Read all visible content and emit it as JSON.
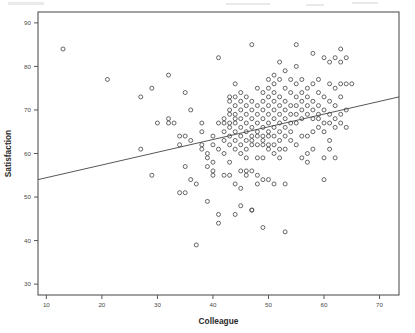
{
  "chart_data": {
    "type": "scatter",
    "title": "",
    "subtitle": "",
    "xlabel": "Colleague",
    "ylabel": "Satisfaction",
    "xlim": [
      8.5,
      73.5
    ],
    "ylim": [
      27.5,
      92.5
    ],
    "xticks": [
      10,
      20,
      30,
      40,
      50,
      60,
      70
    ],
    "xticklabels": [
      "10",
      "20",
      "30",
      "40",
      "50",
      "60",
      "70"
    ],
    "yticks": [
      30,
      40,
      50,
      60,
      70,
      80,
      90
    ],
    "yticklabels": [
      "30",
      "40",
      "50",
      "60",
      "70",
      "80",
      "90"
    ],
    "grid": false,
    "legend": false,
    "marker": "open-circle",
    "marker_color": "#555555",
    "line_color": "#444444",
    "frame": true,
    "fit_line": {
      "type": "linear-regression",
      "x_start": 8.5,
      "y_start": 54.0,
      "x_end": 73.5,
      "y_end": 73.0,
      "style": "solid-thin"
    },
    "points": [
      [
        13,
        84
      ],
      [
        21,
        77
      ],
      [
        27,
        73
      ],
      [
        27,
        61
      ],
      [
        29,
        75
      ],
      [
        29,
        55
      ],
      [
        30,
        67
      ],
      [
        32,
        78
      ],
      [
        32,
        68
      ],
      [
        32,
        67
      ],
      [
        33,
        67
      ],
      [
        34,
        64
      ],
      [
        34,
        62
      ],
      [
        34,
        51
      ],
      [
        35,
        57
      ],
      [
        35,
        64
      ],
      [
        35,
        74
      ],
      [
        35,
        51
      ],
      [
        36,
        70
      ],
      [
        36,
        63
      ],
      [
        36,
        54
      ],
      [
        37,
        39
      ],
      [
        37,
        53
      ],
      [
        38,
        65
      ],
      [
        38,
        61
      ],
      [
        38,
        62
      ],
      [
        38,
        67
      ],
      [
        39,
        60
      ],
      [
        39,
        59
      ],
      [
        39,
        57
      ],
      [
        39,
        49
      ],
      [
        40,
        64
      ],
      [
        40,
        62
      ],
      [
        40,
        58
      ],
      [
        40,
        55
      ],
      [
        40,
        56
      ],
      [
        41,
        67
      ],
      [
        41,
        61
      ],
      [
        41,
        46
      ],
      [
        41,
        44
      ],
      [
        41,
        82
      ],
      [
        42,
        65
      ],
      [
        42,
        68
      ],
      [
        42,
        63
      ],
      [
        42,
        60
      ],
      [
        42,
        55
      ],
      [
        43,
        70
      ],
      [
        43,
        73
      ],
      [
        43,
        72
      ],
      [
        43,
        69
      ],
      [
        43,
        67
      ],
      [
        43,
        66
      ],
      [
        43,
        64
      ],
      [
        43,
        62
      ],
      [
        43,
        58
      ],
      [
        44,
        76
      ],
      [
        44,
        71
      ],
      [
        44,
        69
      ],
      [
        44,
        68
      ],
      [
        44,
        67
      ],
      [
        44,
        65
      ],
      [
        44,
        63
      ],
      [
        44,
        61
      ],
      [
        44,
        53
      ],
      [
        44,
        46
      ],
      [
        45,
        74
      ],
      [
        45,
        72
      ],
      [
        45,
        70
      ],
      [
        45,
        68
      ],
      [
        45,
        66
      ],
      [
        45,
        64
      ],
      [
        45,
        62
      ],
      [
        45,
        56
      ],
      [
        45,
        52
      ],
      [
        45,
        48
      ],
      [
        46,
        73
      ],
      [
        46,
        71
      ],
      [
        46,
        69
      ],
      [
        46,
        67
      ],
      [
        46,
        65
      ],
      [
        46,
        63
      ],
      [
        46,
        61
      ],
      [
        46,
        56
      ],
      [
        46,
        55
      ],
      [
        47,
        85
      ],
      [
        47,
        72
      ],
      [
        47,
        70
      ],
      [
        47,
        68
      ],
      [
        47,
        66
      ],
      [
        47,
        64
      ],
      [
        47,
        63
      ],
      [
        47,
        56
      ],
      [
        47,
        47
      ],
      [
        47,
        47
      ],
      [
        48,
        75
      ],
      [
        48,
        71
      ],
      [
        48,
        69
      ],
      [
        48,
        67
      ],
      [
        48,
        65
      ],
      [
        48,
        64
      ],
      [
        48,
        62
      ],
      [
        48,
        55
      ],
      [
        48,
        53
      ],
      [
        49,
        74
      ],
      [
        49,
        72
      ],
      [
        49,
        70
      ],
      [
        49,
        68
      ],
      [
        49,
        66
      ],
      [
        49,
        64
      ],
      [
        49,
        62
      ],
      [
        49,
        59
      ],
      [
        49,
        54
      ],
      [
        49,
        43
      ],
      [
        50,
        77
      ],
      [
        50,
        75
      ],
      [
        50,
        73
      ],
      [
        50,
        71
      ],
      [
        50,
        69
      ],
      [
        50,
        67
      ],
      [
        50,
        65
      ],
      [
        50,
        64
      ],
      [
        50,
        62
      ],
      [
        50,
        54
      ],
      [
        51,
        78
      ],
      [
        51,
        76
      ],
      [
        51,
        74
      ],
      [
        51,
        72
      ],
      [
        51,
        70
      ],
      [
        51,
        68
      ],
      [
        51,
        66
      ],
      [
        51,
        64
      ],
      [
        51,
        62
      ],
      [
        51,
        53
      ],
      [
        52,
        81
      ],
      [
        52,
        77
      ],
      [
        52,
        73
      ],
      [
        52,
        71
      ],
      [
        52,
        69
      ],
      [
        52,
        67
      ],
      [
        52,
        65
      ],
      [
        52,
        63
      ],
      [
        52,
        61
      ],
      [
        53,
        79
      ],
      [
        53,
        75
      ],
      [
        53,
        72
      ],
      [
        53,
        70
      ],
      [
        53,
        68
      ],
      [
        53,
        66
      ],
      [
        53,
        64
      ],
      [
        53,
        53
      ],
      [
        53,
        42
      ],
      [
        54,
        77
      ],
      [
        54,
        74
      ],
      [
        54,
        71
      ],
      [
        54,
        69
      ],
      [
        54,
        67
      ],
      [
        54,
        65
      ],
      [
        55,
        85
      ],
      [
        55,
        80
      ],
      [
        55,
        76
      ],
      [
        55,
        73
      ],
      [
        55,
        71
      ],
      [
        55,
        69
      ],
      [
        55,
        67
      ],
      [
        56,
        77
      ],
      [
        56,
        74
      ],
      [
        56,
        72
      ],
      [
        56,
        70
      ],
      [
        56,
        68
      ],
      [
        56,
        59
      ],
      [
        57,
        75
      ],
      [
        57,
        73
      ],
      [
        57,
        71
      ],
      [
        57,
        69
      ],
      [
        57,
        60
      ],
      [
        57,
        58
      ],
      [
        58,
        83
      ],
      [
        58,
        76
      ],
      [
        58,
        72
      ],
      [
        58,
        70
      ],
      [
        58,
        68
      ],
      [
        58,
        61
      ],
      [
        59,
        77
      ],
      [
        59,
        74
      ],
      [
        59,
        71
      ],
      [
        59,
        69
      ],
      [
        59,
        66
      ],
      [
        60,
        82
      ],
      [
        60,
        73
      ],
      [
        60,
        70
      ],
      [
        60,
        67
      ],
      [
        60,
        59
      ],
      [
        60,
        54
      ],
      [
        61,
        81
      ],
      [
        61,
        76
      ],
      [
        61,
        72
      ],
      [
        61,
        69
      ],
      [
        61,
        63
      ],
      [
        61,
        61
      ],
      [
        62,
        82
      ],
      [
        62,
        75
      ],
      [
        62,
        71
      ],
      [
        62,
        68
      ],
      [
        62,
        66
      ],
      [
        62,
        59
      ],
      [
        63,
        84
      ],
      [
        63,
        81
      ],
      [
        63,
        76
      ],
      [
        63,
        73
      ],
      [
        63,
        69
      ],
      [
        63,
        67
      ],
      [
        64,
        82
      ],
      [
        64,
        76
      ],
      [
        64,
        70
      ],
      [
        64,
        66
      ],
      [
        65,
        76
      ],
      [
        42,
        67
      ],
      [
        44,
        73
      ],
      [
        46,
        59
      ],
      [
        48,
        59
      ],
      [
        50,
        61
      ],
      [
        52,
        59
      ],
      [
        54,
        63
      ],
      [
        56,
        64
      ],
      [
        58,
        65
      ],
      [
        60,
        65
      ],
      [
        43,
        55
      ],
      [
        45,
        60
      ],
      [
        47,
        62
      ],
      [
        49,
        63
      ],
      [
        51,
        60
      ],
      [
        53,
        61
      ],
      [
        55,
        62
      ],
      [
        57,
        64
      ],
      [
        59,
        68
      ],
      [
        61,
        67
      ]
    ]
  }
}
